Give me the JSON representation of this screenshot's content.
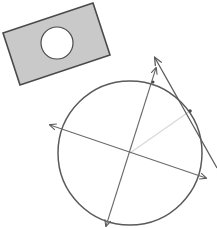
{
  "diagram": {
    "colors": {
      "background": "#ffffff",
      "stroke": "#5a5a5a",
      "plate_fill": "#c9c9c9",
      "hole_fill": "#ffffff",
      "radius_line": "#d8d8d8"
    },
    "plate": {
      "corners": [
        [
          3,
          33
        ],
        [
          93,
          3
        ],
        [
          110,
          55
        ],
        [
          20,
          85
        ]
      ],
      "hole": {
        "cx": 57,
        "cy": 43,
        "r": 16
      }
    },
    "circle": {
      "cx": 130,
      "cy": 153,
      "r": 72
    },
    "axes": [
      {
        "name": "horizontal-axis",
        "x1": 50,
        "y1": 125,
        "x2": 206,
        "y2": 178,
        "arrows": "both"
      },
      {
        "name": "vertical-axis",
        "x1": 156,
        "y1": 68,
        "x2": 106,
        "y2": 226,
        "arrows": "both"
      }
    ],
    "radius": {
      "x1": 130,
      "y1": 153,
      "x2": 190,
      "y2": 111
    },
    "tangent": {
      "x1": 155,
      "y1": 58,
      "x2": 217,
      "y2": 168,
      "arrows": "start"
    },
    "points": [
      {
        "name": "tangent-point",
        "cx": 190,
        "cy": 111
      },
      {
        "name": "axis-intersection-point",
        "cx": 153,
        "cy": 82
      }
    ]
  }
}
